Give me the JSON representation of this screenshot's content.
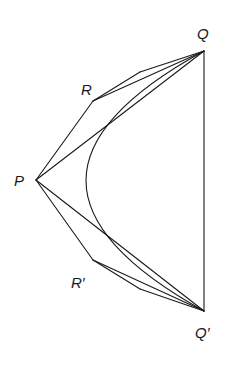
{
  "diagram": {
    "points": {
      "Q": {
        "label": "Q",
        "x": 204,
        "y": 51
      },
      "R": {
        "label": "R",
        "x": 93,
        "y": 101
      },
      "P": {
        "label": "P",
        "x": 36,
        "y": 180
      },
      "R_prime": {
        "label": "R′",
        "x": 93,
        "y": 260
      },
      "Q_prime": {
        "label": "Q′",
        "x": 204,
        "y": 311
      }
    },
    "labels": {
      "Q": "Q",
      "R": "R",
      "P": "P",
      "R_prime": "R′",
      "Q_prime": "Q′"
    },
    "segments": [
      [
        "Q",
        "Q_prime"
      ],
      [
        "P",
        "Q"
      ],
      [
        "P",
        "Q_prime"
      ],
      [
        "P",
        "R"
      ],
      [
        "R",
        "Q"
      ],
      [
        "P",
        "R_prime"
      ],
      [
        "R_prime",
        "Q_prime"
      ]
    ],
    "curve": "parabolic arc from Q through R, P, R' to Q'",
    "stroke_color": "#1a1a1a",
    "background": "#ffffff"
  }
}
